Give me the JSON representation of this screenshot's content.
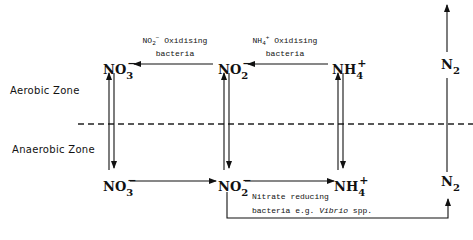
{
  "zones": {
    "aerobic": "Aerobic Zone",
    "anaerobic": "Anaerobic Zone"
  },
  "species": {
    "aerobic_no3": {
      "base": "NO",
      "sub": "3",
      "charge": "−"
    },
    "aerobic_no2": {
      "base": "NO",
      "sub": "2",
      "charge": "−"
    },
    "aerobic_nh4": {
      "base": "NH",
      "sub": "4",
      "charge": "+"
    },
    "aerobic_n2": {
      "base": "N",
      "sub": "2",
      "charge": ""
    },
    "anaerobic_no3": {
      "base": "NO",
      "sub": "3",
      "charge": "−"
    },
    "anaerobic_no2": {
      "base": "NO",
      "sub": "2",
      "charge": "−"
    },
    "anaerobic_nh4": {
      "base": "NH",
      "sub": "4",
      "charge": "+"
    },
    "anaerobic_n2": {
      "base": "N",
      "sub": "2",
      "charge": ""
    }
  },
  "labels": {
    "no2_oxidising": {
      "ion_base": "NO",
      "ion_sub": "2",
      "ion_charge": "−",
      "text": "Oxidising",
      "line2": "bacteria"
    },
    "nh4_oxidising": {
      "ion_base": "NH",
      "ion_sub": "4",
      "ion_charge": "+",
      "text": "Oxidising",
      "line2": "bacteria"
    },
    "nitrate_reducing": {
      "line1": "Nitrate reducing",
      "line2_prefix": "bacteria e.g. ",
      "line2_italic": "Vibrio",
      "line2_suffix": " spp."
    }
  }
}
